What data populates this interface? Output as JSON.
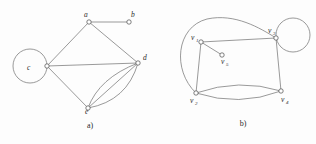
{
  "figure": {
    "background_color": "#fdfdfd",
    "edge_color": "#6e6e6e",
    "vertex_fill": "#ffffff",
    "vertex_stroke": "#4a4a4a",
    "label_color": "#2b2b2b"
  },
  "panels": [
    {
      "caption": "a)",
      "caption_x": 90,
      "caption_y": 128,
      "vertices": [
        {
          "id": "a",
          "label": "a",
          "subscript": "",
          "x": 89,
          "y": 22,
          "label_x": 84,
          "label_y": 17
        },
        {
          "id": "b",
          "label": "b",
          "subscript": "",
          "x": 129,
          "y": 22,
          "label_x": 131,
          "label_y": 17
        },
        {
          "id": "c",
          "label": "c",
          "subscript": "",
          "x": 47,
          "y": 66,
          "label_x": 27,
          "label_y": 70
        },
        {
          "id": "d",
          "label": "d",
          "subscript": "",
          "x": 138,
          "y": 63,
          "label_x": 143,
          "label_y": 60
        },
        {
          "id": "e",
          "label": "e",
          "subscript": "",
          "x": 88,
          "y": 108,
          "label_x": 85,
          "label_y": 114
        }
      ],
      "edges": [
        {
          "from": "a",
          "to": "b",
          "kind": "straight"
        },
        {
          "from": "a",
          "to": "c",
          "kind": "straight"
        },
        {
          "from": "a",
          "to": "d",
          "kind": "straight"
        },
        {
          "from": "c",
          "to": "d",
          "kind": "straight"
        },
        {
          "from": "c",
          "to": "e",
          "kind": "straight"
        },
        {
          "from": "e",
          "to": "d",
          "kind": "straight"
        },
        {
          "from": "e",
          "to": "d",
          "kind": "curve-upper"
        },
        {
          "from": "e",
          "to": "d",
          "kind": "curve-lower"
        }
      ],
      "loops": [
        {
          "at": "c",
          "cx": 30,
          "cy": 66,
          "r": 17
        }
      ]
    },
    {
      "caption": "b)",
      "caption_x": 243,
      "caption_y": 126,
      "vertices": [
        {
          "id": "v1",
          "label": "v",
          "subscript": "1",
          "x": 201,
          "y": 42,
          "label_x": 191,
          "label_y": 40
        },
        {
          "id": "v2",
          "label": "v",
          "subscript": "2",
          "x": 196,
          "y": 93,
          "label_x": 190,
          "label_y": 103
        },
        {
          "id": "v3",
          "label": "v",
          "subscript": "3",
          "x": 276,
          "y": 38,
          "label_x": 268,
          "label_y": 33
        },
        {
          "id": "v4",
          "label": "v",
          "subscript": "4",
          "x": 281,
          "y": 91,
          "label_x": 281,
          "label_y": 102
        },
        {
          "id": "v5",
          "label": "v",
          "subscript": "5",
          "x": 222,
          "y": 55,
          "label_x": 221,
          "label_y": 64
        }
      ],
      "edges": [
        {
          "from": "v1",
          "to": "v3",
          "kind": "straight"
        },
        {
          "from": "v1",
          "to": "v2",
          "kind": "straight"
        },
        {
          "from": "v1",
          "to": "v5",
          "kind": "straight"
        },
        {
          "from": "v3",
          "to": "v4",
          "kind": "straight"
        },
        {
          "from": "v2",
          "to": "v4",
          "kind": "curve-upper"
        },
        {
          "from": "v2",
          "to": "v4",
          "kind": "curve-lower"
        },
        {
          "from": "v2",
          "to": "v3",
          "kind": "outer-arc"
        }
      ],
      "loops": [
        {
          "at": "v3",
          "cx": 293,
          "cy": 35,
          "r": 17
        }
      ]
    }
  ]
}
